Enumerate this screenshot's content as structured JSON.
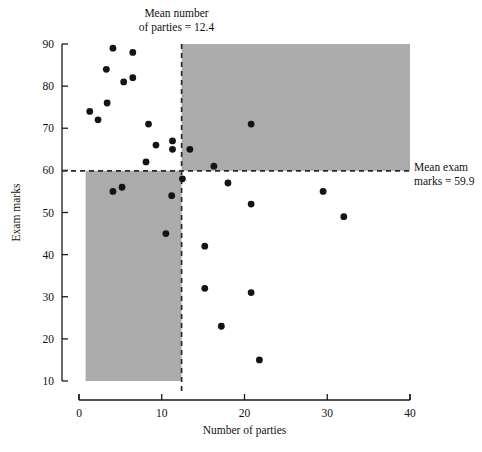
{
  "chart_data": {
    "type": "scatter",
    "title": "",
    "xlabel": "Number of parties",
    "ylabel": "Exam marks",
    "xlim": [
      0,
      40
    ],
    "ylim": [
      10,
      90
    ],
    "xticks": [
      0,
      10,
      20,
      30,
      40
    ],
    "yticks": [
      10,
      20,
      30,
      40,
      50,
      60,
      70,
      80,
      90
    ],
    "xtick_labels": [
      "0",
      "10",
      "20",
      "30",
      "40"
    ],
    "ytick_labels": [
      "10",
      "20",
      "30",
      "40",
      "50",
      "60",
      "70",
      "80",
      "90"
    ],
    "grid": false,
    "legend": null,
    "mean_x": 12.4,
    "mean_y": 59.9,
    "shaded_color": "#ababab",
    "point_color": "#141414",
    "annotations": [
      {
        "name": "mean-parties",
        "text_line1": "Mean number",
        "text_line2": "of parties = 12.4"
      },
      {
        "name": "mean-exam",
        "text_line1": "Mean exam",
        "text_line2": "marks = 59.9"
      }
    ],
    "shaded_quadrants": [
      {
        "name": "top-right",
        "x0": 12.4,
        "x1": 40,
        "y0": 59.9,
        "y1": 90
      },
      {
        "name": "bottom-left",
        "x0": 0.8,
        "x1": 12.4,
        "y0": 10,
        "y1": 59.9
      }
    ],
    "points": [
      {
        "x": 4.1,
        "y": 89
      },
      {
        "x": 6.5,
        "y": 88
      },
      {
        "x": 3.3,
        "y": 84
      },
      {
        "x": 6.5,
        "y": 82
      },
      {
        "x": 5.4,
        "y": 81
      },
      {
        "x": 3.4,
        "y": 76
      },
      {
        "x": 1.3,
        "y": 74
      },
      {
        "x": 2.3,
        "y": 72
      },
      {
        "x": 8.4,
        "y": 71
      },
      {
        "x": 20.8,
        "y": 71
      },
      {
        "x": 11.3,
        "y": 67
      },
      {
        "x": 9.3,
        "y": 66
      },
      {
        "x": 11.3,
        "y": 65
      },
      {
        "x": 13.4,
        "y": 65
      },
      {
        "x": 8.1,
        "y": 62
      },
      {
        "x": 16.3,
        "y": 61
      },
      {
        "x": 12.5,
        "y": 58
      },
      {
        "x": 18.0,
        "y": 57
      },
      {
        "x": 5.2,
        "y": 56
      },
      {
        "x": 4.1,
        "y": 55
      },
      {
        "x": 29.5,
        "y": 55
      },
      {
        "x": 11.2,
        "y": 54
      },
      {
        "x": 32.0,
        "y": 49
      },
      {
        "x": 20.8,
        "y": 52
      },
      {
        "x": 10.5,
        "y": 45
      },
      {
        "x": 15.2,
        "y": 42
      },
      {
        "x": 15.2,
        "y": 32
      },
      {
        "x": 20.8,
        "y": 31
      },
      {
        "x": 17.2,
        "y": 23
      },
      {
        "x": 21.8,
        "y": 15
      }
    ]
  }
}
